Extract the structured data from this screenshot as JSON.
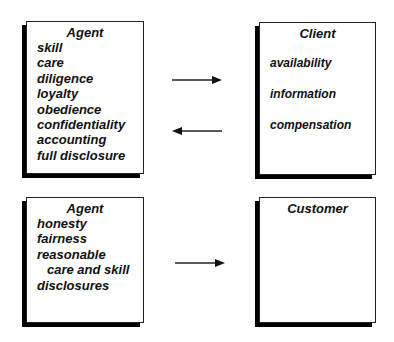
{
  "boxes": {
    "agent_top": {
      "title": "Agent",
      "items": [
        "skill",
        "care",
        "diligence",
        "loyalty",
        "obedience",
        "confidentiality",
        "accounting",
        "full disclosure"
      ]
    },
    "client": {
      "title": "Client",
      "items": [
        "availability",
        "information",
        "compensation"
      ]
    },
    "agent_bottom": {
      "title": "Agent",
      "items": [
        "honesty",
        "fairness",
        "reasonable",
        "care and skill",
        "disclosures"
      ]
    },
    "customer": {
      "title": "Customer",
      "items": []
    }
  },
  "arrows": [
    {
      "from": "agent_top",
      "to": "client",
      "direction": "right"
    },
    {
      "from": "client",
      "to": "agent_top",
      "direction": "left"
    },
    {
      "from": "agent_bottom",
      "to": "customer",
      "direction": "right"
    }
  ],
  "colors": {
    "line": "#222222",
    "shadow": "#000000",
    "background": "#ffffff"
  }
}
